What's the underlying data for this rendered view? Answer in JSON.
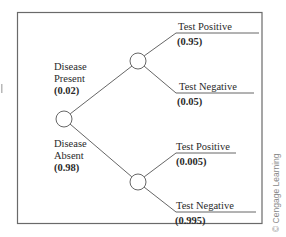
{
  "diagram": {
    "type": "probability-tree",
    "root": {
      "name": "root-chance-node"
    },
    "branches": [
      {
        "label_line1": "Disease",
        "label_line2": "Present",
        "probability": "(0.02)",
        "outcomes": [
          {
            "label": "Test Positive",
            "probability": "(0.95)"
          },
          {
            "label": "Test Negative",
            "probability": "(0.05)"
          }
        ]
      },
      {
        "label_line1": "Disease",
        "label_line2": "Absent",
        "probability": "(0.98)",
        "outcomes": [
          {
            "label": "Test Positive",
            "probability": "(0.005)"
          },
          {
            "label": "Test Negative",
            "probability": "(0.995)"
          }
        ]
      }
    ]
  },
  "watermark": "© Cengage Learning",
  "colors": {
    "line": "#555555",
    "frame": "#6a6a6a",
    "text": "#2a2a2a",
    "watermark": "#8a8a8a"
  }
}
